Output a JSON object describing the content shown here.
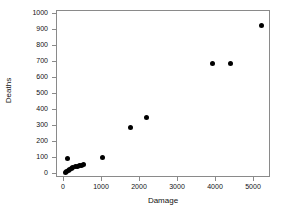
{
  "chart_data": {
    "type": "scatter",
    "title": "",
    "xlabel": "Damage",
    "ylabel": "Deaths",
    "xlim": [
      0,
      5500
    ],
    "ylim": [
      0,
      1000
    ],
    "xticks": [
      0,
      1000,
      2000,
      3000,
      4000,
      5000
    ],
    "yticks": [
      0,
      100,
      200,
      300,
      400,
      500,
      600,
      700,
      800,
      900,
      1000
    ],
    "grid": false,
    "legend": null,
    "marker": {
      "shape": "circle",
      "color": "#000000",
      "size": 5
    },
    "points": [
      {
        "x": 80,
        "y": 100
      },
      {
        "x": 30,
        "y": 12
      },
      {
        "x": 75,
        "y": 18
      },
      {
        "x": 110,
        "y": 22
      },
      {
        "x": 150,
        "y": 28
      },
      {
        "x": 190,
        "y": 32
      },
      {
        "x": 235,
        "y": 40
      },
      {
        "x": 310,
        "y": 46
      },
      {
        "x": 360,
        "y": 48
      },
      {
        "x": 420,
        "y": 52
      },
      {
        "x": 470,
        "y": 55
      },
      {
        "x": 510,
        "y": 58
      },
      {
        "x": 1000,
        "y": 106
      },
      {
        "x": 1737,
        "y": 288
      },
      {
        "x": 2184,
        "y": 356
      },
      {
        "x": 3920,
        "y": 688
      },
      {
        "x": 4370,
        "y": 688
      },
      {
        "x": 5210,
        "y": 931
      }
    ]
  },
  "axes": {
    "x_tick_labels": [
      "0",
      "1000",
      "2000",
      "3000",
      "4000",
      "5000"
    ],
    "y_tick_labels": [
      "0",
      "100",
      "200",
      "300",
      "400",
      "500",
      "600",
      "700",
      "800",
      "900",
      "1000"
    ],
    "x_title": "Damage",
    "y_title": "Deaths"
  },
  "colors": {
    "marker": "#000000",
    "frame": "#8a8a8a",
    "text": "#111111",
    "background": "#ffffff"
  }
}
